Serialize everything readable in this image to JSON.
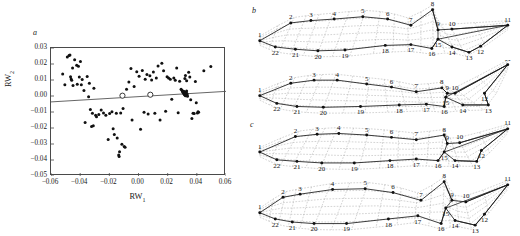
{
  "figure": {
    "panels": [
      {
        "letter": "a",
        "kind": "scatter"
      },
      {
        "letter": "b",
        "kind": "deformation-grid"
      },
      {
        "letter": "c",
        "kind": "deformation-grid"
      }
    ]
  },
  "chart_data": {
    "type": "scatter",
    "title": "",
    "xlabel": "RW1",
    "ylabel": "RW2",
    "xlabel_base": "RW",
    "xlabel_sub": "1",
    "ylabel_base": "RW",
    "ylabel_sub": "2",
    "xlim": [
      -0.06,
      0.06
    ],
    "ylim": [
      -0.05,
      0.03
    ],
    "xticks": [
      -0.06,
      -0.04,
      -0.02,
      0.0,
      0.02,
      0.04,
      0.06
    ],
    "xtick_labels": [
      "−0.06",
      "−0.04",
      "−0.02",
      "0.00",
      "0.02",
      "0.04",
      "0.06"
    ],
    "yticks": [
      0.03,
      0.02,
      0.01,
      0.0,
      -0.01,
      -0.02,
      -0.03,
      -0.04,
      -0.05
    ],
    "ytick_labels": [
      "0.03",
      "0.02",
      "0.01",
      "0.00",
      "−0.01",
      "−0.02",
      "−0.03",
      "−0.04",
      "−0.05"
    ],
    "grid": false,
    "legend": "none",
    "marker": "filled-circle",
    "marker_color": "#111111",
    "line_color": "#555555",
    "regression_line": {
      "x0": -0.06,
      "y0": -0.0037,
      "x1": 0.06,
      "y1": 0.0029
    },
    "open_circles": [
      {
        "x": -0.011,
        "y": 0.0002
      },
      {
        "x": 0.0081,
        "y": 0.0008
      }
    ],
    "points": [
      {
        "x": -0.052,
        "y": 0.0137
      },
      {
        "x": -0.0505,
        "y": 0.007
      },
      {
        "x": -0.0488,
        "y": 0.0243
      },
      {
        "x": -0.0476,
        "y": 0.0253
      },
      {
        "x": -0.047,
        "y": 0.0256
      },
      {
        "x": -0.0466,
        "y": 0.012
      },
      {
        "x": -0.0462,
        "y": 0.0106
      },
      {
        "x": -0.0458,
        "y": 0.0098
      },
      {
        "x": -0.0452,
        "y": 0.0175
      },
      {
        "x": -0.0449,
        "y": 0.0065
      },
      {
        "x": -0.0438,
        "y": 0.0227
      },
      {
        "x": -0.0424,
        "y": 0.0192
      },
      {
        "x": -0.042,
        "y": 0.0074
      },
      {
        "x": -0.0412,
        "y": 0.0186
      },
      {
        "x": -0.0406,
        "y": 0.0118
      },
      {
        "x": -0.0398,
        "y": 0.0216
      },
      {
        "x": -0.0392,
        "y": 0.0071
      },
      {
        "x": -0.0386,
        "y": 0.0103
      },
      {
        "x": -0.0374,
        "y": 0.0035
      },
      {
        "x": -0.0366,
        "y": -0.0165
      },
      {
        "x": -0.0352,
        "y": 0.0122
      },
      {
        "x": -0.0342,
        "y": -0.0005
      },
      {
        "x": -0.0337,
        "y": 0.008
      },
      {
        "x": -0.033,
        "y": -0.0085
      },
      {
        "x": -0.0322,
        "y": -0.019
      },
      {
        "x": -0.0316,
        "y": -0.0108
      },
      {
        "x": -0.031,
        "y": -0.0186
      },
      {
        "x": -0.0306,
        "y": 0.0048
      },
      {
        "x": -0.0294,
        "y": -0.012
      },
      {
        "x": -0.0288,
        "y": -0.013
      },
      {
        "x": -0.0272,
        "y": -0.0115
      },
      {
        "x": -0.0256,
        "y": -0.0088
      },
      {
        "x": -0.024,
        "y": -0.0106
      },
      {
        "x": -0.0224,
        "y": -0.012
      },
      {
        "x": -0.0208,
        "y": -0.0272
      },
      {
        "x": -0.0198,
        "y": -0.011
      },
      {
        "x": -0.0182,
        "y": -0.0098
      },
      {
        "x": -0.0174,
        "y": -0.0205
      },
      {
        "x": -0.0166,
        "y": -0.024
      },
      {
        "x": -0.0152,
        "y": -0.0108
      },
      {
        "x": -0.0146,
        "y": -0.0262
      },
      {
        "x": -0.0136,
        "y": -0.0368
      },
      {
        "x": -0.0133,
        "y": -0.0378
      },
      {
        "x": -0.013,
        "y": -0.0348
      },
      {
        "x": -0.0122,
        "y": -0.0106
      },
      {
        "x": -0.0114,
        "y": -0.0302
      },
      {
        "x": -0.0106,
        "y": -0.0078
      },
      {
        "x": -0.0098,
        "y": -0.0315
      },
      {
        "x": -0.0092,
        "y": -0.032
      },
      {
        "x": -0.0082,
        "y": 0.0042
      },
      {
        "x": -0.0066,
        "y": 0.0088
      },
      {
        "x": -0.0052,
        "y": 0.0172
      },
      {
        "x": -0.0044,
        "y": -0.015
      },
      {
        "x": -0.003,
        "y": 0.006
      },
      {
        "x": -0.0012,
        "y": 0.0152
      },
      {
        "x": 0.0004,
        "y": 0.0124
      },
      {
        "x": 0.0014,
        "y": -0.0208
      },
      {
        "x": 0.0026,
        "y": 0.016
      },
      {
        "x": 0.0038,
        "y": -0.0102
      },
      {
        "x": 0.0046,
        "y": 0.0104
      },
      {
        "x": 0.0058,
        "y": 0.0134
      },
      {
        "x": 0.0066,
        "y": -0.0112
      },
      {
        "x": 0.0078,
        "y": 0.0126
      },
      {
        "x": 0.009,
        "y": 0.01
      },
      {
        "x": 0.0102,
        "y": 0.015
      },
      {
        "x": 0.0112,
        "y": -0.0108
      },
      {
        "x": 0.0122,
        "y": 0.0113
      },
      {
        "x": 0.0134,
        "y": 0.0188
      },
      {
        "x": 0.0148,
        "y": -0.015
      },
      {
        "x": 0.016,
        "y": 0.0205
      },
      {
        "x": 0.0172,
        "y": 0.0158
      },
      {
        "x": 0.0186,
        "y": -0.0096
      },
      {
        "x": 0.0196,
        "y": 0.012
      },
      {
        "x": 0.0206,
        "y": 0.0112
      },
      {
        "x": 0.0218,
        "y": 0.0104
      },
      {
        "x": 0.0228,
        "y": -0.002
      },
      {
        "x": 0.0242,
        "y": 0.0113
      },
      {
        "x": 0.0252,
        "y": 0.0098
      },
      {
        "x": 0.0262,
        "y": 0.0175
      },
      {
        "x": 0.0272,
        "y": -0.0104
      },
      {
        "x": 0.0282,
        "y": 0.0092
      },
      {
        "x": 0.0292,
        "y": 0.0042
      },
      {
        "x": 0.0298,
        "y": 0.0036
      },
      {
        "x": 0.0302,
        "y": 0.003
      },
      {
        "x": 0.0304,
        "y": 0.0026
      },
      {
        "x": 0.0306,
        "y": 0.0022
      },
      {
        "x": 0.0308,
        "y": 0.003
      },
      {
        "x": 0.031,
        "y": 0.0016
      },
      {
        "x": 0.0312,
        "y": 0.0028
      },
      {
        "x": 0.0314,
        "y": 0.001
      },
      {
        "x": 0.0316,
        "y": 0.002
      },
      {
        "x": 0.0318,
        "y": 0.0006
      },
      {
        "x": 0.032,
        "y": 0.0014
      },
      {
        "x": 0.0322,
        "y": 0.0002
      },
      {
        "x": 0.0324,
        "y": 0.0024
      },
      {
        "x": 0.0326,
        "y": 0.0008
      },
      {
        "x": 0.0328,
        "y": 0.0018
      },
      {
        "x": 0.033,
        "y": 0.0032
      },
      {
        "x": 0.0332,
        "y": 0.0004
      },
      {
        "x": 0.0334,
        "y": 0.0012
      },
      {
        "x": 0.0336,
        "y": -0.0002
      },
      {
        "x": 0.0318,
        "y": 0.011
      },
      {
        "x": 0.0322,
        "y": 0.0128
      },
      {
        "x": 0.033,
        "y": 0.0095
      },
      {
        "x": 0.0344,
        "y": 0.0148
      },
      {
        "x": 0.0352,
        "y": 0.0118
      },
      {
        "x": 0.0358,
        "y": -0.0024
      },
      {
        "x": 0.0366,
        "y": -0.014
      },
      {
        "x": 0.0374,
        "y": -0.0108
      },
      {
        "x": 0.0382,
        "y": -0.011
      },
      {
        "x": 0.039,
        "y": 0.009
      },
      {
        "x": 0.0396,
        "y": -0.0042
      },
      {
        "x": 0.0404,
        "y": -0.0106
      },
      {
        "x": 0.0408,
        "y": -0.0098
      },
      {
        "x": 0.0412,
        "y": -0.0102
      },
      {
        "x": 0.0448,
        "y": 0.0158
      },
      {
        "x": 0.0496,
        "y": 0.0184
      }
    ]
  },
  "deformation_grids": {
    "landmark_labels": [
      "1",
      "2",
      "3",
      "4",
      "5",
      "6",
      "7",
      "8",
      "9",
      "10",
      "11",
      "12",
      "13",
      "14",
      "15",
      "16",
      "17",
      "18",
      "19",
      "20",
      "21",
      "22"
    ],
    "grid_color": "#9a9a9a",
    "outline_color": "#1a1a1a",
    "node_color": "#111111",
    "figures": [
      {
        "id": "grid-b-top",
        "caption": "b",
        "points": {
          "1": [
            10,
            50
          ],
          "2": [
            50,
            27
          ],
          "3": [
            76,
            24
          ],
          "4": [
            106,
            22
          ],
          "5": [
            143,
            19
          ],
          "6": [
            175,
            22
          ],
          "7": [
            205,
            30
          ],
          "8": [
            233,
            10
          ],
          "9": [
            240,
            36
          ],
          "10": [
            258,
            35
          ],
          "11": [
            330,
            30
          ],
          "12": [
            295,
            57
          ],
          "13": [
            280,
            65
          ],
          "14": [
            258,
            58
          ],
          "15": [
            240,
            48
          ],
          "16": [
            232,
            60
          ],
          "17": [
            205,
            55
          ],
          "18": [
            172,
            56
          ],
          "19": [
            120,
            62
          ],
          "20": [
            85,
            63
          ],
          "21": [
            56,
            61
          ],
          "22": [
            30,
            58
          ]
        }
      },
      {
        "id": "grid-b-bottom",
        "caption": "",
        "points": {
          "1": [
            10,
            46
          ],
          "2": [
            50,
            30
          ],
          "3": [
            80,
            26
          ],
          "4": [
            110,
            26
          ],
          "5": [
            148,
            31
          ],
          "6": [
            180,
            35
          ],
          "7": [
            212,
            41
          ],
          "8": [
            245,
            36
          ],
          "9": [
            252,
            43
          ],
          "10": [
            262,
            43
          ],
          "11": [
            330,
            6
          ],
          "12": [
            300,
            43
          ],
          "13": [
            305,
            58
          ],
          "14": [
            272,
            58
          ],
          "15": [
            250,
            48
          ],
          "16": [
            248,
            60
          ],
          "17": [
            225,
            57
          ],
          "18": [
            190,
            58
          ],
          "19": [
            140,
            60
          ],
          "20": [
            92,
            61
          ],
          "21": [
            58,
            60
          ],
          "22": [
            32,
            56
          ]
        }
      },
      {
        "id": "grid-c-top",
        "caption": "c",
        "points": {
          "1": [
            10,
            44
          ],
          "2": [
            56,
            24
          ],
          "3": [
            84,
            21
          ],
          "4": [
            112,
            20
          ],
          "5": [
            148,
            22
          ],
          "6": [
            180,
            25
          ],
          "7": [
            212,
            28
          ],
          "8": [
            248,
            22
          ],
          "9": [
            252,
            33
          ],
          "10": [
            268,
            32
          ],
          "11": [
            330,
            14
          ],
          "12": [
            296,
            42
          ],
          "13": [
            290,
            56
          ],
          "14": [
            262,
            55
          ],
          "15": [
            248,
            44
          ],
          "16": [
            240,
            55
          ],
          "17": [
            212,
            53
          ],
          "18": [
            178,
            55
          ],
          "19": [
            132,
            58
          ],
          "20": [
            90,
            58
          ],
          "21": [
            58,
            56
          ],
          "22": [
            32,
            54
          ]
        }
      },
      {
        "id": "grid-c-bottom",
        "caption": "",
        "points": {
          "1": [
            10,
            50
          ],
          "2": [
            40,
            30
          ],
          "3": [
            62,
            26
          ],
          "4": [
            104,
            20
          ],
          "5": [
            146,
            19
          ],
          "6": [
            182,
            24
          ],
          "7": [
            218,
            34
          ],
          "8": [
            248,
            10
          ],
          "9": [
            258,
            34
          ],
          "10": [
            276,
            36
          ],
          "11": [
            330,
            14
          ],
          "12": [
            300,
            52
          ],
          "13": [
            288,
            66
          ],
          "14": [
            262,
            60
          ],
          "15": [
            250,
            44
          ],
          "16": [
            244,
            64
          ],
          "17": [
            214,
            54
          ],
          "18": [
            176,
            58
          ],
          "19": [
            122,
            64
          ],
          "20": [
            80,
            64
          ],
          "21": [
            52,
            62
          ],
          "22": [
            30,
            58
          ]
        }
      }
    ]
  }
}
